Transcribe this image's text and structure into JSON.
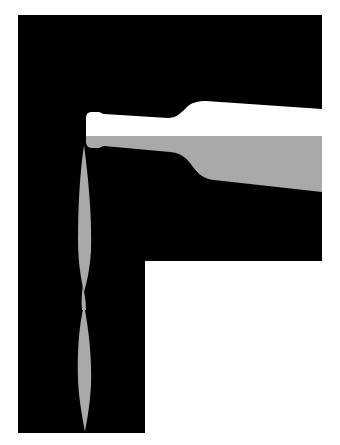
{
  "artwork": {
    "subject": "wine bottle pouring into letter-shaped black field",
    "colors": {
      "background": "#ffffff",
      "field": "#000000",
      "bottle": "#ffffff",
      "wine": "#a9a9a9"
    },
    "shapes": {
      "field_letter": "F",
      "bottle_orientation": "horizontal, neck pointing left",
      "stream_segments": 2
    }
  }
}
